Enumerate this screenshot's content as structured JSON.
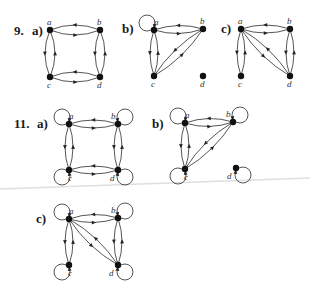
{
  "problems": [
    {
      "number": "9.",
      "parts": [
        {
          "label": "a)",
          "label_pos": [
            32,
            24
          ],
          "nodes": [
            {
              "id": "a",
              "x": 50,
              "y": 30,
              "lx": -1,
              "ly": -5
            },
            {
              "id": "b",
              "x": 100,
              "y": 30,
              "lx": -1,
              "ly": -5
            },
            {
              "id": "c",
              "x": 50,
              "y": 77,
              "lx": -1,
              "ly": 11
            },
            {
              "id": "d",
              "x": 100,
              "y": 77,
              "lx": -1,
              "ly": 11
            }
          ],
          "edges": [
            {
              "from": "a",
              "to": "b",
              "bend": 5
            },
            {
              "from": "b",
              "to": "a",
              "bend": 5
            },
            {
              "from": "a",
              "to": "c",
              "bend": 5
            },
            {
              "from": "c",
              "to": "a",
              "bend": 5
            },
            {
              "from": "b",
              "to": "d",
              "bend": 5
            },
            {
              "from": "d",
              "to": "b",
              "bend": 5
            },
            {
              "from": "c",
              "to": "d",
              "bend": 5
            },
            {
              "from": "d",
              "to": "c",
              "bend": 5
            }
          ],
          "loops": []
        },
        {
          "label": "b)",
          "label_pos": [
            122,
            22
          ],
          "nodes": [
            {
              "id": "a",
              "x": 154,
              "y": 30,
              "lx": 2,
              "ly": -5
            },
            {
              "id": "b",
              "x": 203,
              "y": 29,
              "lx": -1,
              "ly": -5
            },
            {
              "id": "c",
              "x": 154,
              "y": 76,
              "lx": -1,
              "ly": 11
            },
            {
              "id": "d",
              "x": 203,
              "y": 76,
              "lx": -1,
              "ly": 11
            }
          ],
          "edges": [
            {
              "from": "a",
              "to": "b",
              "bend": 4
            },
            {
              "from": "b",
              "to": "a",
              "bend": 4
            },
            {
              "from": "a",
              "to": "c",
              "bend": 4
            },
            {
              "from": "c",
              "to": "a",
              "bend": 4
            },
            {
              "from": "b",
              "to": "c",
              "bend": 4
            },
            {
              "from": "c",
              "to": "b",
              "bend": 4
            }
          ],
          "loops": [
            {
              "node": "a",
              "dir": "upleft"
            }
          ]
        },
        {
          "label": "c)",
          "label_pos": [
            221,
            22
          ],
          "nodes": [
            {
              "id": "a",
              "x": 241,
              "y": 29,
              "lx": -1,
              "ly": -5
            },
            {
              "id": "b",
              "x": 290,
              "y": 29,
              "lx": -1,
              "ly": -5
            },
            {
              "id": "c",
              "x": 241,
              "y": 76,
              "lx": -1,
              "ly": 11
            },
            {
              "id": "d",
              "x": 290,
              "y": 76,
              "lx": -1,
              "ly": 11
            }
          ],
          "edges": [
            {
              "from": "a",
              "to": "b",
              "bend": 4
            },
            {
              "from": "b",
              "to": "a",
              "bend": 4
            },
            {
              "from": "a",
              "to": "c",
              "bend": 4
            },
            {
              "from": "c",
              "to": "a",
              "bend": 4
            },
            {
              "from": "b",
              "to": "d",
              "bend": 4
            },
            {
              "from": "d",
              "to": "b",
              "bend": 4
            },
            {
              "from": "a",
              "to": "d",
              "bend": 4
            },
            {
              "from": "d",
              "to": "a",
              "bend": 4
            }
          ],
          "loops": []
        }
      ],
      "number_pos": [
        14,
        24
      ]
    },
    {
      "number": "11.",
      "number_pos": [
        14,
        117
      ],
      "parts": [
        {
          "label": "a)",
          "label_pos": [
            37,
            117
          ],
          "nodes": [
            {
              "id": "a",
              "x": 69,
              "y": 124,
              "lx": 2,
              "ly": -5
            },
            {
              "id": "b",
              "x": 118,
              "y": 124,
              "lx": -5,
              "ly": -5
            },
            {
              "id": "c",
              "x": 69,
              "y": 170,
              "lx": 1,
              "ly": 11
            },
            {
              "id": "d",
              "x": 118,
              "y": 170,
              "lx": -6,
              "ly": 11
            }
          ],
          "edges": [
            {
              "from": "a",
              "to": "b",
              "bend": 4
            },
            {
              "from": "b",
              "to": "a",
              "bend": 4
            },
            {
              "from": "a",
              "to": "c",
              "bend": 4
            },
            {
              "from": "c",
              "to": "a",
              "bend": 4
            },
            {
              "from": "b",
              "to": "d",
              "bend": 4
            },
            {
              "from": "d",
              "to": "b",
              "bend": 4
            },
            {
              "from": "c",
              "to": "d",
              "bend": 4
            },
            {
              "from": "d",
              "to": "c",
              "bend": 4
            }
          ],
          "loops": [
            {
              "node": "a",
              "dir": "upleft"
            },
            {
              "node": "b",
              "dir": "upright"
            },
            {
              "node": "c",
              "dir": "downleft"
            },
            {
              "node": "d",
              "dir": "downright"
            }
          ]
        },
        {
          "label": "b)",
          "label_pos": [
            152,
            117
          ],
          "nodes": [
            {
              "id": "a",
              "x": 185,
              "y": 123,
              "lx": 2,
              "ly": -5
            },
            {
              "id": "b",
              "x": 233,
              "y": 122,
              "lx": -5,
              "ly": -5
            },
            {
              "id": "c",
              "x": 185,
              "y": 169,
              "lx": 1,
              "ly": 11
            },
            {
              "id": "d",
              "x": 236,
              "y": 168,
              "lx": -7,
              "ly": 11
            }
          ],
          "edges": [
            {
              "from": "a",
              "to": "b",
              "bend": 4
            },
            {
              "from": "b",
              "to": "a",
              "bend": 4
            },
            {
              "from": "a",
              "to": "c",
              "bend": 4
            },
            {
              "from": "c",
              "to": "a",
              "bend": 4
            },
            {
              "from": "b",
              "to": "c",
              "bend": 4
            },
            {
              "from": "c",
              "to": "b",
              "bend": 4
            }
          ],
          "loops": [
            {
              "node": "a",
              "dir": "upleft"
            },
            {
              "node": "b",
              "dir": "upright"
            },
            {
              "node": "c",
              "dir": "downleft"
            },
            {
              "node": "d",
              "dir": "downright"
            }
          ]
        },
        {
          "label": "c)",
          "label_pos": [
            36,
            212
          ],
          "nodes": [
            {
              "id": "a",
              "x": 69,
              "y": 219,
              "lx": 2,
              "ly": -5
            },
            {
              "id": "b",
              "x": 118,
              "y": 218,
              "lx": -5,
              "ly": -5
            },
            {
              "id": "c",
              "x": 69,
              "y": 265,
              "lx": 1,
              "ly": 11
            },
            {
              "id": "d",
              "x": 118,
              "y": 265,
              "lx": -7,
              "ly": 11
            }
          ],
          "edges": [
            {
              "from": "a",
              "to": "b",
              "bend": 4
            },
            {
              "from": "b",
              "to": "a",
              "bend": 4
            },
            {
              "from": "a",
              "to": "c",
              "bend": 4
            },
            {
              "from": "c",
              "to": "a",
              "bend": 4
            },
            {
              "from": "b",
              "to": "d",
              "bend": 4
            },
            {
              "from": "d",
              "to": "b",
              "bend": 4
            },
            {
              "from": "a",
              "to": "d",
              "bend": 4
            },
            {
              "from": "d",
              "to": "a",
              "bend": 4
            }
          ],
          "loops": [
            {
              "node": "a",
              "dir": "upleft"
            },
            {
              "node": "b",
              "dir": "upright"
            },
            {
              "node": "c",
              "dir": "downleft"
            },
            {
              "node": "d",
              "dir": "downright"
            }
          ]
        }
      ]
    }
  ],
  "colors": {
    "ink": "#222222",
    "node": "#111111",
    "background": "#ffffff",
    "scan_artifact": "#d8d8d8"
  }
}
